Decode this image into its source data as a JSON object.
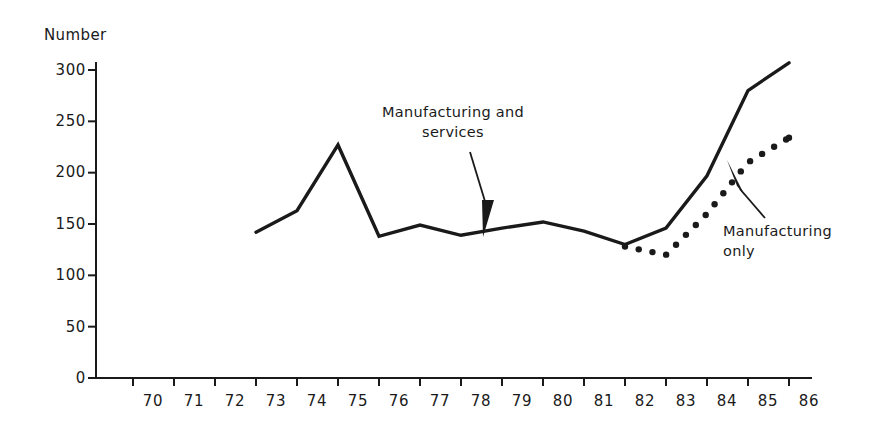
{
  "figure": {
    "background_color": "#ffffff",
    "ink_color": "#1a1a1a"
  },
  "chart_data": {
    "type": "line",
    "title": "",
    "subtitle": "",
    "xlabel": "",
    "ylabel": "Number",
    "ylim": [
      0,
      310
    ],
    "xlim": [
      70,
      86
    ],
    "grid": false,
    "legend_position": "inline-annotations",
    "yticks": [
      0,
      50,
      100,
      150,
      200,
      250,
      300
    ],
    "ytick_labels": [
      "0",
      "50",
      "100",
      "150",
      "200",
      "250",
      "300"
    ],
    "xticks": [
      70,
      71,
      72,
      73,
      74,
      75,
      76,
      77,
      78,
      79,
      80,
      81,
      82,
      83,
      84,
      85,
      86
    ],
    "xtick_labels": [
      "70",
      "71",
      "72",
      "73",
      "74",
      "75",
      "76",
      "77",
      "78",
      "79",
      "80",
      "81",
      "82",
      "83",
      "84",
      "85",
      "86"
    ],
    "series": [
      {
        "name": "Manufacturing and services",
        "style": "solid",
        "x": [
          73,
          74,
          75,
          76,
          77,
          78,
          79,
          80,
          81,
          82,
          83,
          84,
          85,
          86
        ],
        "values": [
          142,
          163,
          227,
          138,
          149,
          139,
          146,
          152,
          143,
          130,
          146,
          197,
          280,
          307
        ]
      },
      {
        "name": "Manufacturing only",
        "style": "dotted",
        "x": [
          82,
          83,
          84,
          85,
          86
        ],
        "values": [
          128,
          120,
          160,
          210,
          234
        ]
      }
    ],
    "annotations": [
      {
        "id": "manufacturing-and-services",
        "text_lines": [
          "Manufacturing and",
          "services"
        ],
        "arrow": "down",
        "points_to_series": "Manufacturing and services"
      },
      {
        "id": "manufacturing-only",
        "text_lines": [
          "Manufacturing",
          "only"
        ],
        "arrow": "up-left",
        "points_to_series": "Manufacturing only"
      }
    ]
  }
}
